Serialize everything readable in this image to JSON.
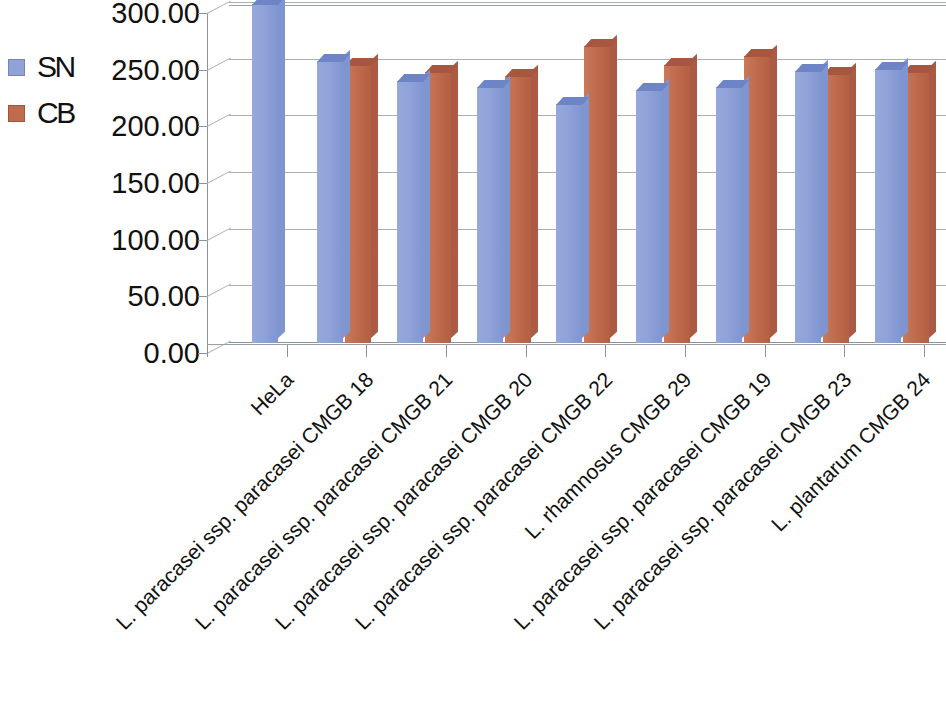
{
  "chart_data": {
    "type": "bar",
    "title": "",
    "subtitle": "",
    "xlabel": "",
    "ylabel": "",
    "ylim": [
      0,
      300
    ],
    "ytick_labels": [
      "300.00",
      "250.00",
      "200.00",
      "150.00",
      "100.00",
      "50.00",
      "0.00"
    ],
    "ytick_values": [
      300,
      250,
      200,
      150,
      100,
      50,
      0
    ],
    "grid": true,
    "legend_position": "left",
    "three_d": true,
    "categories": [
      "HeLa",
      "L. paracasei ssp. paracasei CMGB 18",
      "L. paracasei ssp. paracasei CMGB 21",
      "L. paracasei ssp. paracasei CMGB 20",
      "L. paracasei ssp. paracasei CMGB 22",
      "L. rhamnosus CMGB 29",
      "L. paracasei ssp. paracasei CMGB 19",
      "L. paracasei ssp. paracasei CMGB 23",
      "L. plantarum CMGB 24"
    ],
    "series": [
      {
        "name": "SN",
        "color": "#8FA3D9",
        "values": [
          299,
          249,
          231,
          226,
          211,
          223,
          226,
          240,
          242
        ]
      },
      {
        "name": "CB",
        "color": "#C06B4C",
        "values": [
          null,
          245,
          239,
          236,
          262,
          245,
          253,
          237,
          239
        ]
      }
    ]
  },
  "legend": {
    "items": [
      {
        "label": "SN",
        "color": "#8FA3D9",
        "swatch_name": "legend-swatch-sn"
      },
      {
        "label": "CB",
        "color": "#C06B4C",
        "swatch_name": "legend-swatch-cb"
      }
    ]
  },
  "axes": {
    "y": {
      "ticks": [
        {
          "label": "300.00",
          "value": 300
        },
        {
          "label": "250.00",
          "value": 250
        },
        {
          "label": "200.00",
          "value": 200
        },
        {
          "label": "150.00",
          "value": 150
        },
        {
          "label": "100.00",
          "value": 100
        },
        {
          "label": "50.00",
          "value": 50
        },
        {
          "label": "0.00",
          "value": 0
        }
      ]
    },
    "x": {
      "ticks": [
        {
          "label": "HeLa"
        },
        {
          "label": "L. paracasei ssp. paracasei CMGB 18"
        },
        {
          "label": "L. paracasei ssp. paracasei CMGB 21"
        },
        {
          "label": "L. paracasei ssp. paracasei CMGB 20"
        },
        {
          "label": "L. paracasei ssp. paracasei CMGB 22"
        },
        {
          "label": "L. rhamnosus CMGB 29"
        },
        {
          "label": "L. paracasei ssp. paracasei CMGB 19"
        },
        {
          "label": "L. paracasei ssp. paracasei CMGB 23"
        },
        {
          "label": "L. plantarum CMGB 24"
        }
      ]
    }
  },
  "colors": {
    "series_sn": "#8FA3D9",
    "series_cb": "#C06B4C",
    "gridline": "#A8B0B4",
    "axis": "#8D9498",
    "background": "#FFFFFF",
    "text": "#111111"
  }
}
